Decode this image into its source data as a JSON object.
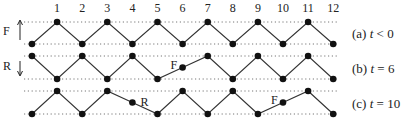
{
  "diagram": {
    "node_labels": [
      "1",
      "2",
      "3",
      "4",
      "5",
      "6",
      "7",
      "8",
      "9",
      "10",
      "11",
      "12"
    ],
    "rows": [
      {
        "id": "a",
        "caption_prefix": "(a) ",
        "caption_var": "t",
        "caption_rel": " < 0",
        "levels": [
          "low",
          "high",
          "low",
          "high",
          "low",
          "high",
          "low",
          "high",
          "low",
          "high",
          "low",
          "high",
          "low"
        ],
        "side_label": "F",
        "side_arrow": "up",
        "markers": []
      },
      {
        "id": "b",
        "caption_prefix": "(b) ",
        "caption_var": "t",
        "caption_rel": " = 6",
        "levels": [
          "high",
          "low",
          "high",
          "low",
          "high",
          "low",
          "mid",
          "high",
          "low",
          "high",
          "low",
          "high",
          "low"
        ],
        "side_label": "R",
        "side_arrow": "down",
        "markers": [
          {
            "node": 6,
            "label": "F"
          }
        ]
      },
      {
        "id": "c",
        "caption_prefix": "(c) ",
        "caption_var": "t",
        "caption_rel": " = 10",
        "levels": [
          "low",
          "high",
          "low",
          "high",
          "mid",
          "low",
          "high",
          "low",
          "high",
          "low",
          "mid",
          "high",
          "low"
        ],
        "side_label": "",
        "side_arrow": "",
        "markers": [
          {
            "node": 4,
            "label": "R"
          },
          {
            "node": 10,
            "label": "F"
          }
        ]
      }
    ],
    "colors": {
      "line": "#333333",
      "node": "#111111",
      "dotted": "#777777"
    }
  }
}
